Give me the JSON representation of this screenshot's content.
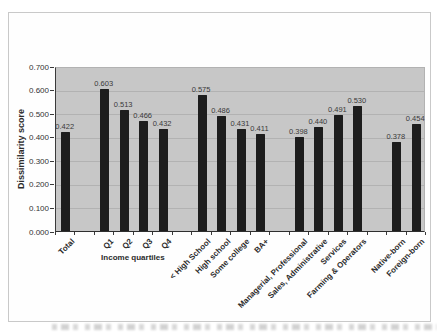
{
  "chart_data": {
    "type": "bar",
    "title": "",
    "xlabel": "",
    "ylabel": "Dissimilarity score",
    "ylim": [
      0,
      0.7
    ],
    "ytick_labels": [
      "0.000",
      "0.100",
      "0.200",
      "0.300",
      "0.400",
      "0.500",
      "0.600",
      "0.700"
    ],
    "grid": true,
    "legend": "none",
    "bar_color": "#1d1d1d",
    "plot_background": "#c7c7c7",
    "gridline_color": "#b2b2b2",
    "groups": [
      {
        "label": "",
        "items": [
          {
            "label": "Total",
            "value": 0.422
          }
        ]
      },
      {
        "label": "Income quartiles",
        "items": [
          {
            "label": "Q1",
            "value": 0.603
          },
          {
            "label": "Q2",
            "value": 0.513
          },
          {
            "label": "Q3",
            "value": 0.466
          },
          {
            "label": "Q4",
            "value": 0.432
          }
        ]
      },
      {
        "label": "",
        "items": [
          {
            "label": "< High School",
            "value": 0.575
          },
          {
            "label": "High school",
            "value": 0.486
          },
          {
            "label": "Some college",
            "value": 0.431
          },
          {
            "label": "BA+",
            "value": 0.411
          }
        ]
      },
      {
        "label": "",
        "items": [
          {
            "label": "Managerial, Professional",
            "value": 0.398
          },
          {
            "label": "Sales, Administrative",
            "value": 0.44
          },
          {
            "label": "Services",
            "value": 0.491
          },
          {
            "label": "Farming & Operators",
            "value": 0.53
          }
        ]
      },
      {
        "label": "",
        "items": [
          {
            "label": "Native-born",
            "value": 0.378
          },
          {
            "label": "Foreign-born",
            "value": 0.454
          }
        ]
      }
    ]
  }
}
